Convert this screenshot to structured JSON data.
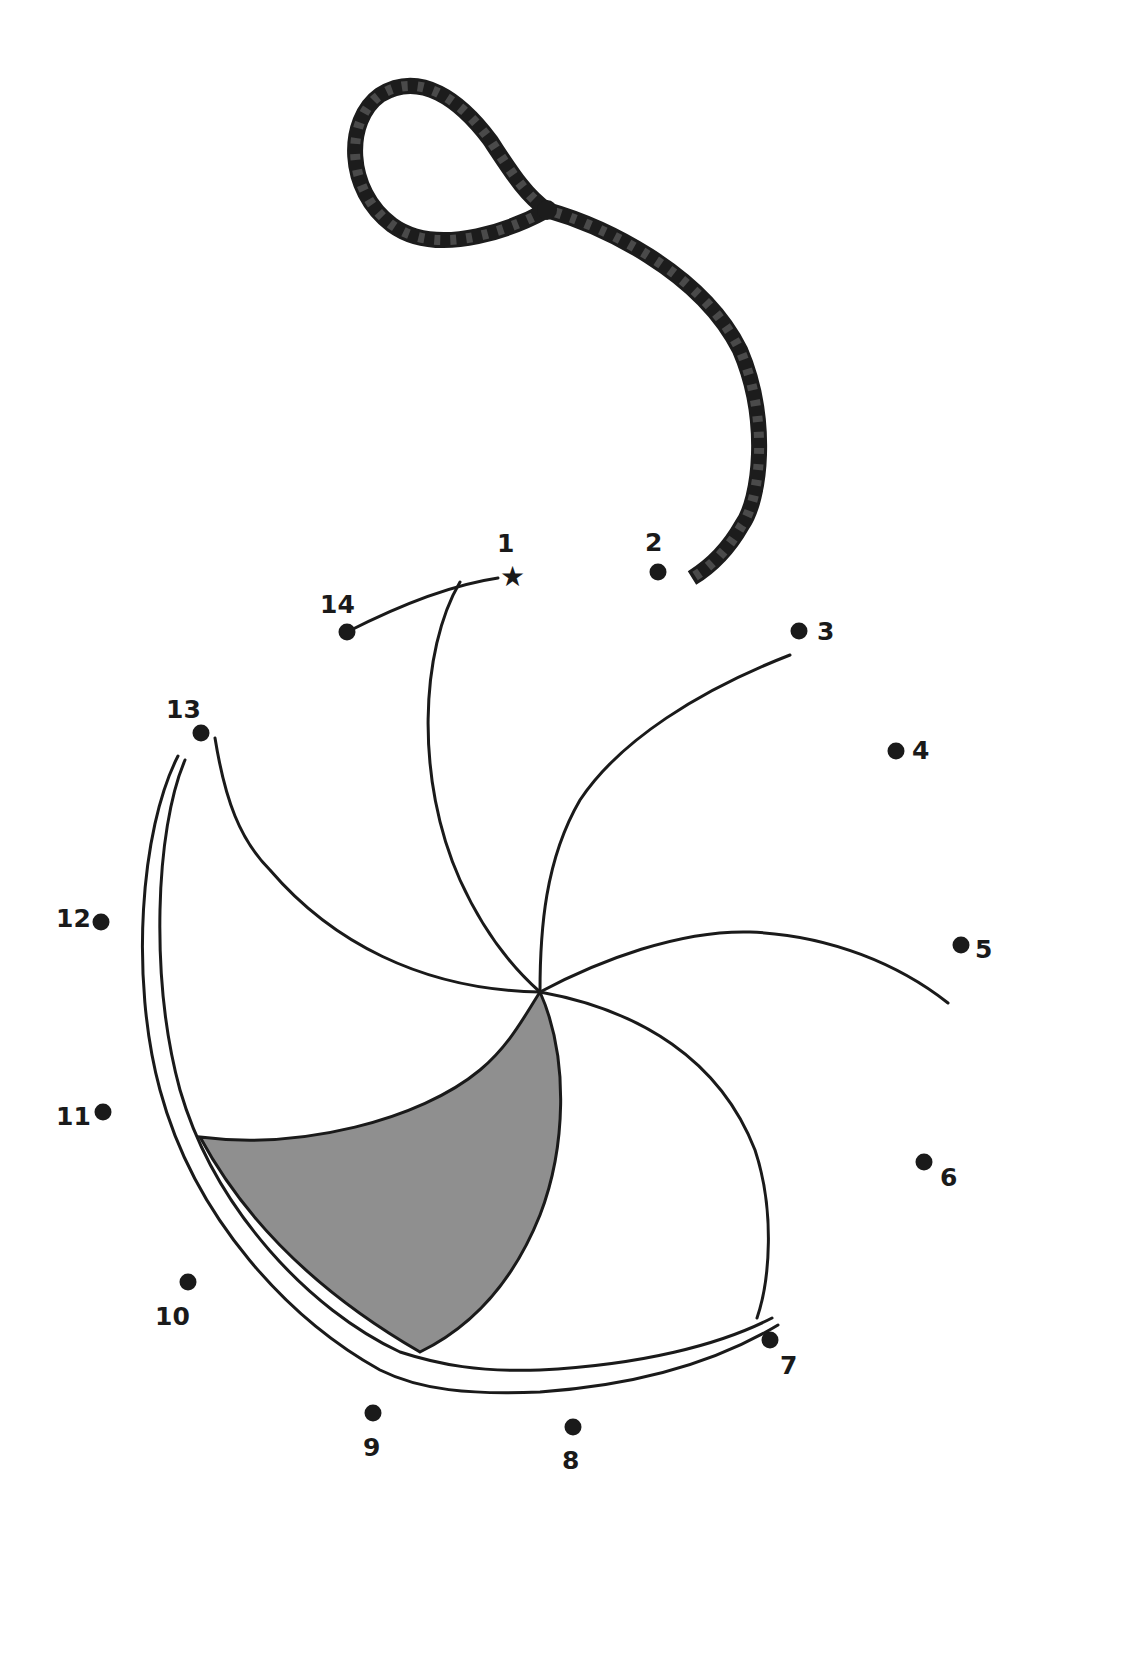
{
  "puzzle": {
    "title": "Connect the dots",
    "fill_color": "#8f8f8f",
    "line_color": "#1a1a1a",
    "start_marker": "star-icon",
    "dots": [
      {
        "n": "1",
        "x": 512,
        "y": 576,
        "lx": 497,
        "ly": 552,
        "start": true
      },
      {
        "n": "2",
        "x": 658,
        "y": 572,
        "lx": 645,
        "ly": 551
      },
      {
        "n": "3",
        "x": 799,
        "y": 631,
        "lx": 817,
        "ly": 640
      },
      {
        "n": "4",
        "x": 896,
        "y": 751,
        "lx": 912,
        "ly": 759
      },
      {
        "n": "5",
        "x": 961,
        "y": 945,
        "lx": 975,
        "ly": 958
      },
      {
        "n": "6",
        "x": 924,
        "y": 1162,
        "lx": 940,
        "ly": 1186
      },
      {
        "n": "7",
        "x": 770,
        "y": 1340,
        "lx": 780,
        "ly": 1374
      },
      {
        "n": "8",
        "x": 573,
        "y": 1427,
        "lx": 562,
        "ly": 1469
      },
      {
        "n": "9",
        "x": 373,
        "y": 1413,
        "lx": 363,
        "ly": 1456
      },
      {
        "n": "10",
        "x": 188,
        "y": 1282,
        "lx": 155,
        "ly": 1325
      },
      {
        "n": "11",
        "x": 103,
        "y": 1112,
        "lx": 56,
        "ly": 1125
      },
      {
        "n": "12",
        "x": 101,
        "y": 922,
        "lx": 56,
        "ly": 927
      },
      {
        "n": "13",
        "x": 201,
        "y": 733,
        "lx": 166,
        "ly": 718
      },
      {
        "n": "14",
        "x": 347,
        "y": 632,
        "lx": 320,
        "ly": 613
      }
    ]
  }
}
